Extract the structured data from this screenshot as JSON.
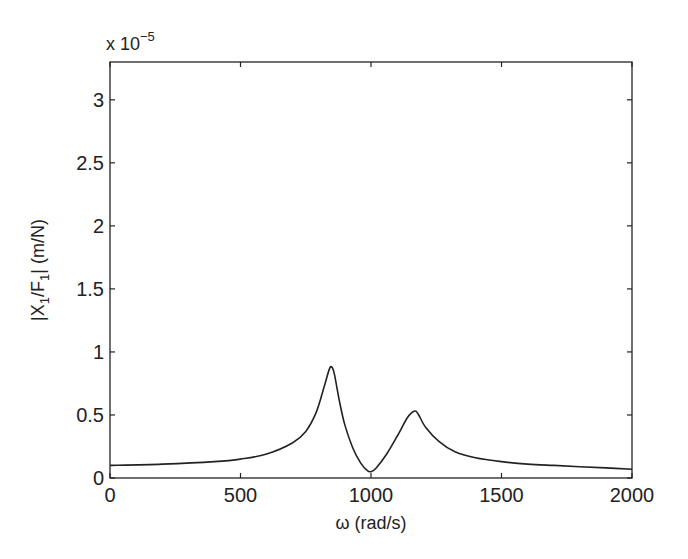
{
  "chart_data": {
    "type": "line",
    "title": "",
    "xlabel": "ω (rad/s)",
    "ylabel_parts": {
      "pre": "|X",
      "sub1": "1",
      "mid": "/F",
      "sub2": "1",
      "post": "| (m/N)"
    },
    "ylabel": "|X1/F1| (m/N)",
    "y_exponent_label": {
      "base": "x 10",
      "exp": "−5"
    },
    "xlim": [
      0,
      2000
    ],
    "ylim": [
      0,
      3.3
    ],
    "x_ticks": [
      0,
      500,
      1000,
      1500,
      2000
    ],
    "x_tick_labels": [
      "0",
      "500",
      "1000",
      "1500",
      "2000"
    ],
    "y_ticks": [
      0,
      0.5,
      1,
      1.5,
      2,
      2.5,
      3
    ],
    "y_tick_labels": [
      "0",
      "0.5",
      "1",
      "1.5",
      "2",
      "2.5",
      "3"
    ],
    "grid": false,
    "legend": null,
    "series": [
      {
        "name": "|X1/F1|",
        "color": "#222222",
        "x": [
          0,
          200,
          400,
          500,
          600,
          700,
          750,
          790,
          820,
          840,
          850,
          860,
          880,
          900,
          930,
          960,
          985,
          1000,
          1020,
          1060,
          1100,
          1140,
          1165,
          1180,
          1210,
          1260,
          1320,
          1400,
          1500,
          1600,
          1700,
          1800,
          1900,
          2000
        ],
        "values": [
          0.1,
          0.11,
          0.13,
          0.15,
          0.19,
          0.28,
          0.37,
          0.52,
          0.72,
          0.86,
          0.88,
          0.82,
          0.6,
          0.42,
          0.24,
          0.12,
          0.06,
          0.05,
          0.08,
          0.19,
          0.33,
          0.48,
          0.53,
          0.51,
          0.4,
          0.29,
          0.21,
          0.16,
          0.13,
          0.11,
          0.1,
          0.09,
          0.08,
          0.07
        ]
      }
    ]
  }
}
